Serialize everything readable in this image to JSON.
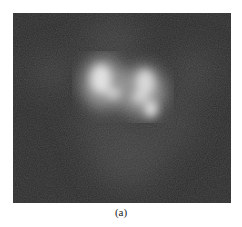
{
  "figure": {
    "caption": "(a)",
    "colors": {
      "background": "#2a2a2a",
      "glow": "#d8d8d8",
      "hotspot": "#f2f2f2",
      "page": "#ffffff"
    }
  }
}
